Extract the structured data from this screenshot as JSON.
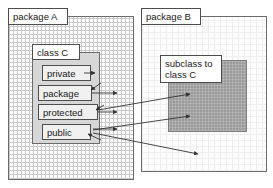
{
  "diagram": {
    "width": 273,
    "height": 188,
    "colors": {
      "frame_border": "#6b6b6b",
      "label_border": "#4d4d4d",
      "class_fill": "#d7d7d7",
      "member_fill": "#f0f0f0",
      "subclass_fill": "#9a9a9a",
      "arrow": "#333333",
      "background": "#ffffff"
    }
  },
  "packages": [
    {
      "id": "package-a",
      "label": "package A",
      "fill_style": "dense-grid",
      "x": 8,
      "y": 8,
      "width": 126,
      "height": 172
    },
    {
      "id": "package-b",
      "label": "package B",
      "fill_style": "faint-grid",
      "x": 141,
      "y": 8,
      "width": 126,
      "height": 172
    }
  ],
  "class_box": {
    "label": "class C",
    "x": 32,
    "y": 44,
    "width": 68,
    "height": 100,
    "members": [
      {
        "id": "private",
        "label": "private"
      },
      {
        "id": "package",
        "label": "package"
      },
      {
        "id": "protected",
        "label": "protected"
      },
      {
        "id": "public",
        "label": "public"
      }
    ]
  },
  "subclass_box": {
    "label": "subclass to class C",
    "label_line_1": "subclass to",
    "label_line_2": "class C",
    "x": 168,
    "y": 60,
    "width": 79,
    "height": 72
  },
  "arrows": [
    {
      "id": "private-to-inside-class",
      "from": "private",
      "to": "inside-class-c"
    },
    {
      "id": "package-to-inside-package-a",
      "from": "package",
      "to": "inside-package-a"
    },
    {
      "id": "package-inbound",
      "from": "package-a",
      "to": "package"
    },
    {
      "id": "protected-to-package-a",
      "from": "protected",
      "to": "inside-package-a"
    },
    {
      "id": "protected-to-subclass",
      "from": "protected",
      "to": "subclass-box"
    },
    {
      "id": "public-to-package-a",
      "from": "public",
      "to": "inside-package-a"
    },
    {
      "id": "public-to-subclass",
      "from": "public",
      "to": "subclass-box"
    },
    {
      "id": "public-to-package-b",
      "from": "public",
      "to": "inside-package-b"
    },
    {
      "id": "public-inbound",
      "from": "package-b",
      "to": "public"
    }
  ]
}
